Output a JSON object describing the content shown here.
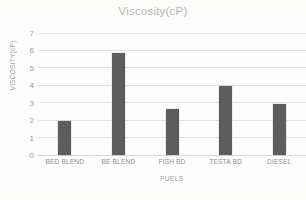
{
  "chart_data": {
    "type": "bar",
    "title": "Viscosity(cP)",
    "xlabel": "FUELS",
    "ylabel": "VISCOSITY(cP)",
    "categories": [
      "BED BLEND",
      "BE BLEND",
      "FISH BD",
      "TESTA BD",
      "DIESEL"
    ],
    "values": [
      1.95,
      5.85,
      2.65,
      3.95,
      2.9
    ],
    "ylim": [
      0,
      7
    ],
    "ytick_labels": [
      "0",
      "1",
      "2",
      "3",
      "4",
      "5",
      "6",
      "7"
    ],
    "ytick_values": [
      0,
      1,
      2,
      3,
      4,
      5,
      6,
      7
    ],
    "grid": true,
    "legend": "none",
    "series_name": "Viscosity(cP)",
    "bar_color": "#5d5d5d",
    "gridline_color": "#e2e2e2",
    "text_color": "#8f8f8f",
    "title_color": "#8a8a8a",
    "background_color": "#fdfdfd"
  }
}
